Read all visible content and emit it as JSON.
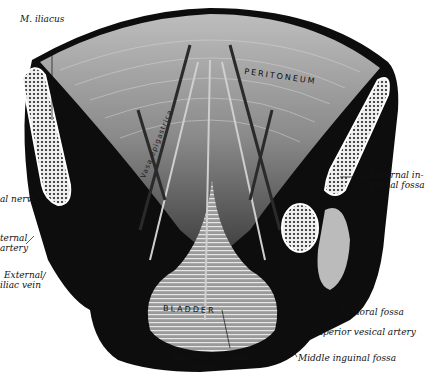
{
  "figure": {
    "region_labels": {
      "peritoneum": "PERITONEUM",
      "bladder": "BLADDER",
      "vertical_vessel_label": "Vasa epigastrica"
    },
    "labels": [
      {
        "id": "m-iliacus",
        "text": "M. iliacus"
      },
      {
        "id": "femoral-nerve",
        "text": "al nerve"
      },
      {
        "id": "external-iliac-artery-1",
        "text": "ternal"
      },
      {
        "id": "external-iliac-artery-2",
        "text": "artery"
      },
      {
        "id": "external-iliac-vein-1",
        "text": "External"
      },
      {
        "id": "external-iliac-vein-2",
        "text": "iliac vein"
      },
      {
        "id": "external-inguinal-fossa-1",
        "text": "External in-"
      },
      {
        "id": "external-inguinal-fossa-2",
        "text": "guinal fossa"
      },
      {
        "id": "femoral-fossa",
        "text": "Femoral fossa"
      },
      {
        "id": "superior-vesical-artery",
        "text": "Superior vesical artery"
      },
      {
        "id": "middle-inguinal-fossa",
        "text": "Middle inguinal fossa"
      },
      {
        "id": "internal-inguinal-fossa-1",
        "text": "Internal inguinal"
      },
      {
        "id": "internal-inguinal-fossa-2",
        "text": "fossa"
      }
    ]
  }
}
